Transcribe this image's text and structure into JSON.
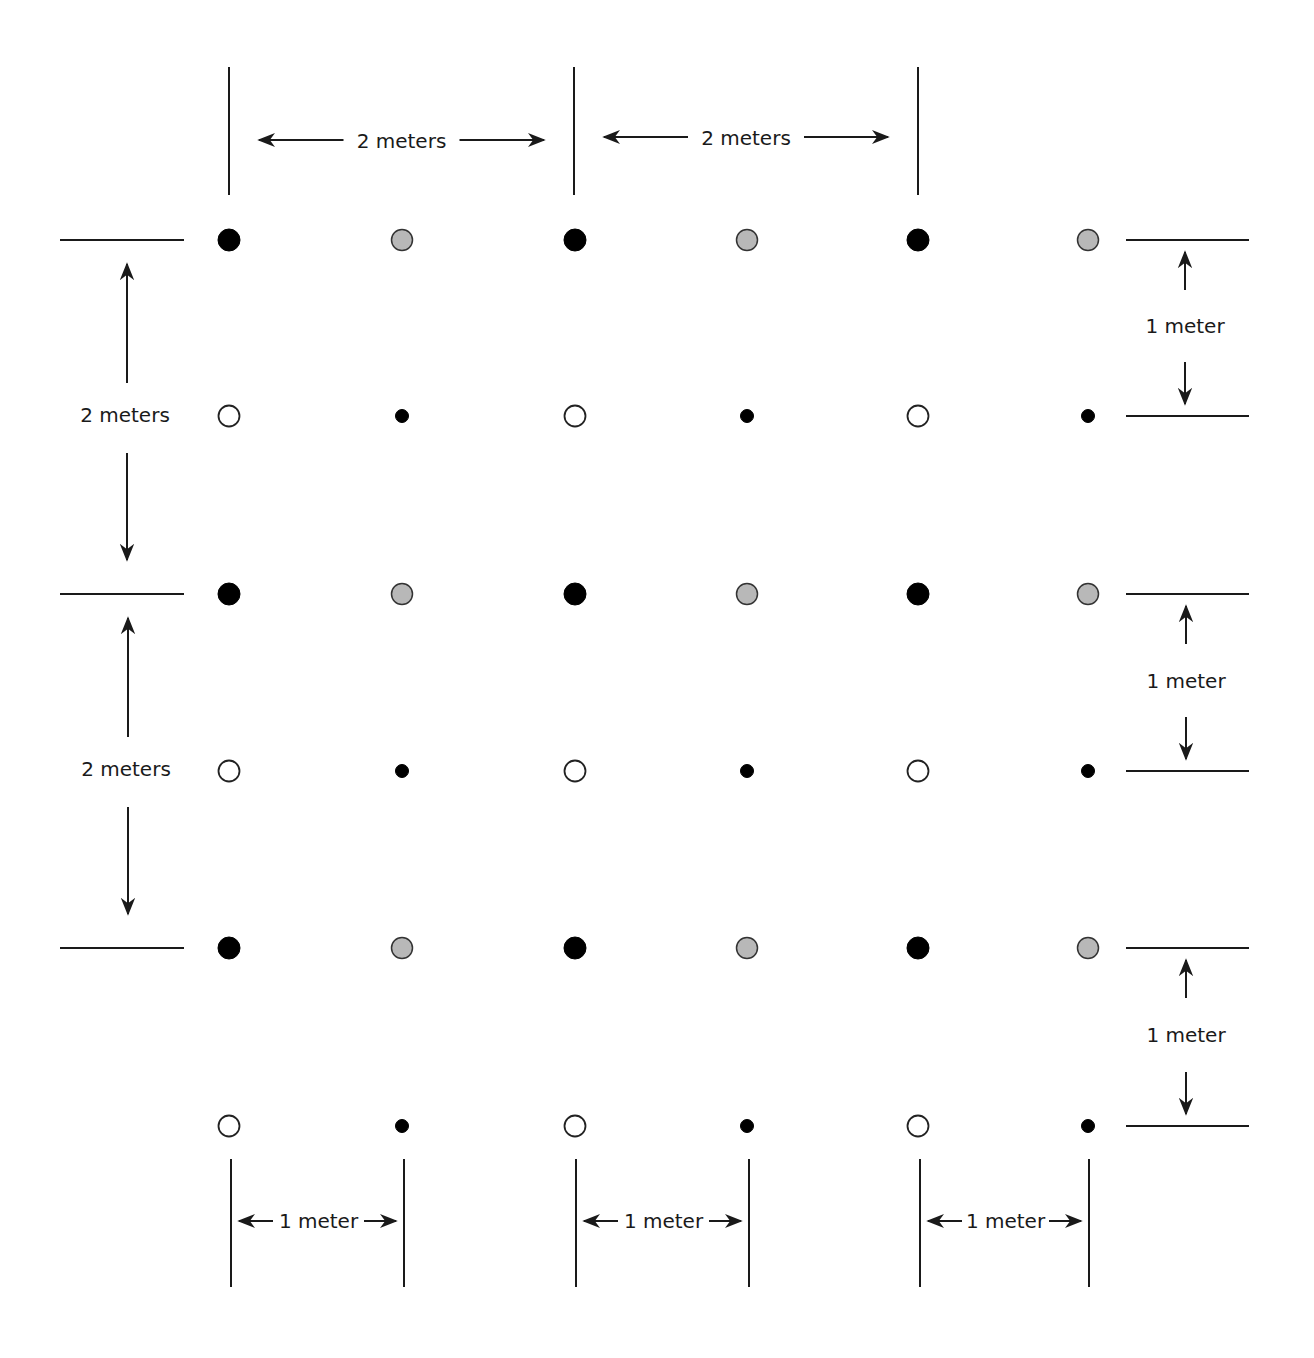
{
  "diagram": {
    "type": "plant spacing grid",
    "colors": {
      "black": "#000000",
      "gray_fill": "#b8b8b8",
      "open_fill": "#ffffff",
      "stroke": "#1a1a1a",
      "background": "#ffffff"
    },
    "legend_of_markers": {
      "large_black": "large solid black circle",
      "gray": "gray-filled circle",
      "open": "open (white) circle",
      "small_black": "small solid black dot"
    },
    "grid": {
      "columns_x": [
        229,
        402,
        575,
        747,
        918,
        1088
      ],
      "rows_y": [
        240,
        416,
        594,
        771,
        948,
        1126
      ],
      "row_patterns": [
        [
          "large_black",
          "gray",
          "large_black",
          "gray",
          "large_black",
          "gray"
        ],
        [
          "open",
          "small_black",
          "open",
          "small_black",
          "open",
          "small_black"
        ],
        [
          "large_black",
          "gray",
          "large_black",
          "gray",
          "large_black",
          "gray"
        ],
        [
          "open",
          "small_black",
          "open",
          "small_black",
          "open",
          "small_black"
        ],
        [
          "large_black",
          "gray",
          "large_black",
          "gray",
          "large_black",
          "gray"
        ],
        [
          "open",
          "small_black",
          "open",
          "small_black",
          "open",
          "small_black"
        ]
      ]
    },
    "dimensions": {
      "top": [
        {
          "label": "2 meters",
          "x1": 229,
          "x2": 574,
          "y": 140
        },
        {
          "label": "2 meters",
          "x1": 574,
          "x2": 918,
          "y": 137
        }
      ],
      "left": [
        {
          "label": "2 meters",
          "y1": 240,
          "y2": 594,
          "x": 127
        },
        {
          "label": "2 meters",
          "y1": 594,
          "y2": 948,
          "x": 128
        }
      ],
      "right": [
        {
          "label": "1 meter",
          "y1": 240,
          "y2": 416,
          "x": 1185
        },
        {
          "label": "1 meter",
          "y1": 594,
          "y2": 771,
          "x": 1186
        },
        {
          "label": "1 meter",
          "y1": 948,
          "y2": 1126,
          "x": 1186
        }
      ],
      "bottom": [
        {
          "label": "1 meter",
          "x1": 231,
          "x2": 404,
          "y": 1221
        },
        {
          "label": "1 meter",
          "x1": 576,
          "x2": 749,
          "y": 1221
        },
        {
          "label": "1 meter",
          "x1": 920,
          "x2": 1089,
          "y": 1221
        }
      ]
    }
  }
}
